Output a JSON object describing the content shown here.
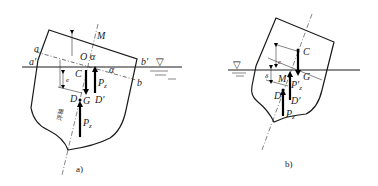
{
  "figure": {
    "panels": [
      {
        "id": "a",
        "caption": "a)",
        "labels": {
          "M": "M",
          "O": "O",
          "alpha_top": "α",
          "alpha_side": "α",
          "a": "a",
          "a_prime": "a'",
          "b": "b",
          "b_prime": "b'",
          "C": "C",
          "G": "G",
          "D": "D",
          "D_prime": "D'",
          "Pz_upper": "P",
          "Pz_upper_sub": "z",
          "Pz_lower": "P",
          "Pz_lower_sub": "z",
          "e": "e",
          "floating_axis": "浮轴"
        },
        "water_symbol": "▽"
      },
      {
        "id": "b",
        "caption": "b)",
        "labels": {
          "C": "C",
          "G": "G",
          "M": "M",
          "D": "D",
          "D_prime": "D'",
          "Pz_prime": "P'",
          "Pz_prime_sub": "z",
          "Pz": "P",
          "Pz_sub": "z",
          "e": "e",
          "delta": "δ"
        },
        "water_symbol": "▽"
      }
    ]
  }
}
